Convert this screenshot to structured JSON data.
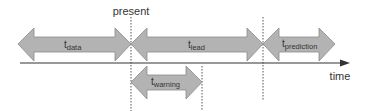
{
  "diagram": {
    "labels": {
      "present": "present",
      "time": "time"
    },
    "intervals": [
      {
        "id": "data",
        "base": "t",
        "sub": "data"
      },
      {
        "id": "lead",
        "base": "t",
        "sub": "lead"
      },
      {
        "id": "prediction",
        "base": "t",
        "sub": "prediction"
      },
      {
        "id": "warning",
        "base": "t",
        "sub": "warning"
      }
    ],
    "colors": {
      "arrow_fill": "#b3b3b3",
      "arrow_stroke": "#8a8a8a",
      "axis": "#333333",
      "dotted": "#555555"
    }
  }
}
